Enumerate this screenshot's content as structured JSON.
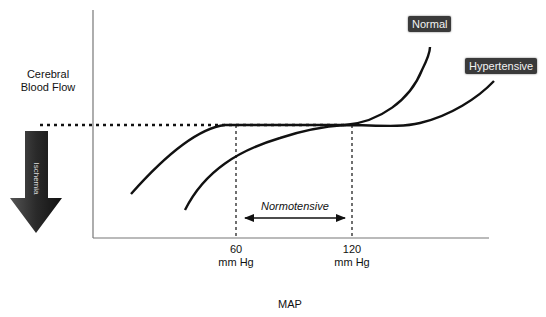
{
  "diagram": {
    "y_axis_label": "Cerebral Blood Flow",
    "x_axis_label": "MAP",
    "ischemia_label": "Ischemia",
    "range_label": "Normotensive",
    "ticks": [
      {
        "value": "60",
        "unit": "mm Hg"
      },
      {
        "value": "120",
        "unit": "mm Hg"
      }
    ],
    "curves": [
      {
        "name": "Normal",
        "color": "#111111"
      },
      {
        "name": "Hypertensive",
        "color": "#111111"
      }
    ],
    "colors": {
      "line": "#111111",
      "axis": "#777777",
      "tag_bg": "#3a3a3a",
      "arrow_dark": "#222222"
    }
  }
}
